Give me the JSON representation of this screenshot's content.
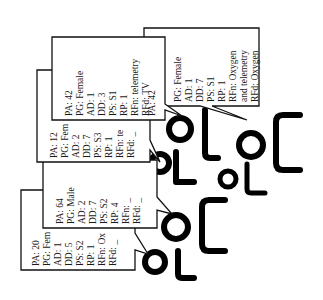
{
  "diagram": {
    "type": "patient-callout-diagram",
    "line_color": "#111111",
    "icon_color": "#000000",
    "callouts": [
      {
        "id": "c1",
        "lines": [
          "PG: Female",
          "AD: 1",
          "DD: 7",
          "PS: S1",
          "RP: 1",
          "RFn: Oxygen",
          "and telemetry",
          "RFd: Oxygen"
        ]
      },
      {
        "id": "c2",
        "lines": [
          "PA: 42",
          "PG: Female",
          "AD: 1",
          "DD: 3",
          "PS: S1",
          "RP: 1",
          "RFn: telemetry",
          "RFd: TV",
          "PA: 42"
        ]
      },
      {
        "id": "c3",
        "lines": [
          "PA: 12",
          "PG: Fem",
          "AD: 2",
          "DD: 7",
          "PS: S3",
          "RP: 1",
          "RFn: te",
          "RFd: _"
        ]
      },
      {
        "id": "c4",
        "lines": [
          "PA: 64",
          "PG: Male",
          "AD: 2",
          "DD: 7",
          "PS: S2",
          "RP: 4",
          "RFn: _",
          "RFd: _"
        ]
      },
      {
        "id": "c5",
        "lines": [
          "PA: 20",
          "PG: Fem",
          "AD: 1",
          "DD: 5",
          "PS: S2",
          "RP: 1",
          "RFn: Ox",
          "RFd: _"
        ]
      }
    ],
    "patients": [
      {
        "id": "p1",
        "icon": "patient-bed-icon"
      },
      {
        "id": "p2",
        "icon": "patient-bed-icon"
      },
      {
        "id": "p3",
        "icon": "patient-bed-icon"
      },
      {
        "id": "p4",
        "icon": "patient-bed-icon"
      },
      {
        "id": "p5",
        "icon": "patient-bed-icon"
      },
      {
        "id": "p6",
        "icon": "patient-bed-icon"
      }
    ]
  }
}
